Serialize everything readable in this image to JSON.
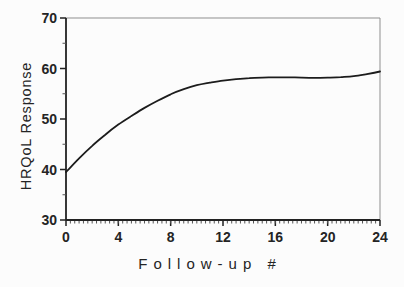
{
  "figure": {
    "background": "#fcfcfc",
    "curve_color": "#1c1c1c",
    "axis_color": "#222222",
    "frame_color": "#8f8f8f",
    "text_color": "#242424"
  },
  "chart_data": {
    "type": "line",
    "title": "",
    "xlabel": "Follow-up #",
    "ylabel": "HRQoL Response",
    "xlim": [
      0,
      24
    ],
    "ylim": [
      30,
      70
    ],
    "xticks": [
      0,
      4,
      8,
      12,
      16,
      20,
      24
    ],
    "yticks": [
      30,
      40,
      50,
      60,
      70
    ],
    "x_minor_step": 0.3333,
    "y_minor_step": 5,
    "grid": false,
    "legend": "none",
    "frame": "full-box",
    "series": [
      {
        "name": "HRQoL response curve",
        "x": [
          0,
          1,
          2,
          3,
          4,
          5,
          6,
          7,
          8,
          9,
          10,
          11,
          12,
          13,
          14,
          15,
          16,
          17,
          18,
          19,
          20,
          21,
          22,
          23,
          24
        ],
        "y": [
          39.5,
          42.2,
          44.7,
          46.9,
          48.9,
          50.6,
          52.2,
          53.6,
          54.9,
          55.9,
          56.7,
          57.2,
          57.6,
          57.9,
          58.1,
          58.2,
          58.25,
          58.25,
          58.2,
          58.15,
          58.2,
          58.3,
          58.5,
          58.9,
          59.4
        ]
      }
    ]
  }
}
